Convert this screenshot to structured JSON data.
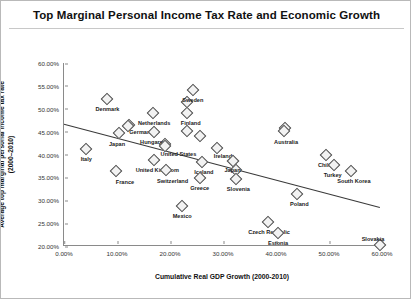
{
  "chart_data": {
    "type": "scatter",
    "title": "Top Marginal Personal Income Tax Rate and Economic Growth",
    "xlabel": "Cumulative Real GDP Growth (2000-2010)",
    "ylabel_line1": "Average top marginal personal income tax rate",
    "ylabel_line2": "(2000–2010)",
    "xlim": [
      0,
      60
    ],
    "ylim": [
      20,
      60
    ],
    "xticks": [
      "0.00%",
      "10.00%",
      "20.00%",
      "30.00%",
      "40.00%",
      "50.00%",
      "60.00%"
    ],
    "xtick_values": [
      0,
      10,
      20,
      30,
      40,
      50,
      60
    ],
    "yticks": [
      "20.00%",
      "25.00%",
      "30.00%",
      "35.00%",
      "40.00%",
      "45.00%",
      "50.00%",
      "55.00%",
      "60.00%"
    ],
    "ytick_values": [
      20,
      25,
      30,
      35,
      40,
      45,
      50,
      55,
      60
    ],
    "grid": false,
    "legend": "none",
    "marker": "open-diamond",
    "trendline": {
      "x0": 0.0,
      "y0": 46.6,
      "x1": 59.6,
      "y1": 28.4
    },
    "points": [
      {
        "label": "Denmark",
        "x": 8.2,
        "y": 52.2,
        "lx": 8.2,
        "ly_off": 7
      },
      {
        "label": "Italy",
        "x": 4.2,
        "y": 41.3,
        "lx": 4.2,
        "ly_off": 7
      },
      {
        "label": "Japan",
        "x": 10.3,
        "y": 44.8,
        "lx": 10.0,
        "ly_off": 8
      },
      {
        "label": "Germany",
        "x": 12.0,
        "y": 46.3,
        "lx": 14.6,
        "ly_off": 3
      },
      {
        "label": "Netherlands",
        "x": 16.8,
        "y": 49.1,
        "lx": 17.0,
        "ly_off": 7
      },
      {
        "label": "Hungary",
        "x": 16.9,
        "y": 44.9,
        "lx": 16.5,
        "ly_off": 7
      },
      {
        "label": "France",
        "x": 9.8,
        "y": 36.3,
        "lx": 11.5,
        "ly_off": 8
      },
      {
        "label": "United Kingdom",
        "x": 17.0,
        "y": 38.9,
        "lx": 17.6,
        "ly_off": 7
      },
      {
        "label": "United States",
        "x": 19.0,
        "y": 41.9,
        "lx": 21.6,
        "ly_off": 5
      },
      {
        "label": "Switzerland",
        "x": 19.3,
        "y": 36.6,
        "lx": 20.5,
        "ly_off": 8
      },
      {
        "label": "Sweden",
        "x": 24.3,
        "y": 54.1,
        "lx": 24.3,
        "ly_off": 7
      },
      {
        "label": "Finland",
        "x": 23.3,
        "y": 49.0,
        "lx": 23.9,
        "ly_off": 7
      },
      {
        "label": "Iceland",
        "x": 26.1,
        "y": 38.3,
        "lx": 26.4,
        "ly_off": 7
      },
      {
        "label": "Greece",
        "x": 25.6,
        "y": 34.9,
        "lx": 25.6,
        "ly_off": 7
      },
      {
        "label": "Mexico",
        "x": 22.3,
        "y": 28.8,
        "lx": 22.3,
        "ly_off": 7
      },
      {
        "label": "Ireland",
        "x": 28.8,
        "y": 41.5,
        "lx": 30.0,
        "ly_off": 5
      },
      {
        "label": "Japan",
        "x": 31.8,
        "y": 38.6,
        "lx": 31.8,
        "ly_off": 6
      },
      {
        "label": "Slovenia",
        "x": 32.5,
        "y": 34.7,
        "lx": 32.9,
        "ly_off": 7
      },
      {
        "label": "Australia",
        "x": 41.6,
        "y": 45.2,
        "lx": 41.9,
        "ly_off": 8
      },
      {
        "label": "Chile",
        "x": 49.4,
        "y": 39.9,
        "lx": 49.2,
        "ly_off": 7
      },
      {
        "label": "Turkey",
        "x": 51.0,
        "y": 37.8,
        "lx": 50.7,
        "ly_off": 7
      },
      {
        "label": "South Korea",
        "x": 54.1,
        "y": 36.3,
        "lx": 54.7,
        "ly_off": 7
      },
      {
        "label": "Poland",
        "x": 44.0,
        "y": 31.3,
        "lx": 44.4,
        "ly_off": 7
      },
      {
        "label": "Czech Republic",
        "x": 38.5,
        "y": 25.3,
        "lx": 38.7,
        "ly_off": 7
      },
      {
        "label": "Estonia",
        "x": 40.4,
        "y": 22.8,
        "lx": 40.4,
        "ly_off": 7
      },
      {
        "label": "Slovakia",
        "x": 59.6,
        "y": 20.3,
        "lx": 58.3,
        "ly_off": -9
      }
    ],
    "unlabeled_points": [
      {
        "x": 12.2,
        "y": 46.4
      },
      {
        "x": 19.1,
        "y": 42.2
      },
      {
        "x": 23.2,
        "y": 51.4
      },
      {
        "x": 23.3,
        "y": 45.2
      },
      {
        "x": 25.6,
        "y": 44.0
      },
      {
        "x": 31.9,
        "y": 38.5
      },
      {
        "x": 32.4,
        "y": 36.7
      },
      {
        "x": 41.7,
        "y": 45.8
      }
    ]
  }
}
